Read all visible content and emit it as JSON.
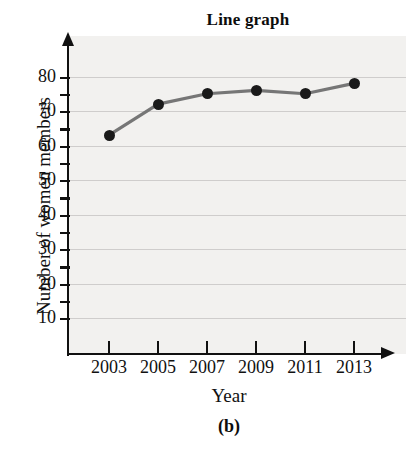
{
  "chart_data": {
    "type": "line",
    "title": "Line graph",
    "xlabel": "Year",
    "ylabel": "Number of women members",
    "caption": "(b)",
    "categories": [
      "2003",
      "2005",
      "2007",
      "2009",
      "2011",
      "2013"
    ],
    "x": [
      2003,
      2005,
      2007,
      2009,
      2011,
      2013
    ],
    "values": [
      63,
      72,
      75,
      76,
      75,
      78
    ],
    "series": [
      {
        "name": "Number of women members",
        "values": [
          63,
          72,
          75,
          76,
          75,
          78
        ]
      }
    ],
    "ytick_labels": [
      "10",
      "20",
      "30",
      "40",
      "50",
      "60",
      "70",
      "80"
    ],
    "yticks": [
      10,
      20,
      30,
      40,
      50,
      60,
      70,
      80
    ],
    "ylim": [
      0,
      85
    ],
    "xlim": [
      2002,
      2014
    ],
    "grid": "horizontal",
    "legend": "none",
    "line_color": "#767676",
    "marker_color": "#1a1a1a",
    "axis_color": "#111111",
    "gridline_color": "#c9c7c5",
    "panel_color": "#f2f1ef",
    "marker_style": "filled-circle"
  }
}
